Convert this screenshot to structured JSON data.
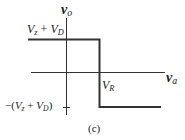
{
  "figure": {
    "caption": "(c)",
    "y_axis_label": {
      "base": "v",
      "sub": "o"
    },
    "x_axis_label": {
      "base": "v",
      "sub": "a"
    },
    "upper_level_label": {
      "a": "V",
      "a_sub": "z",
      "op": " + ",
      "b": "V",
      "b_sub": "D"
    },
    "lower_level_label": {
      "prefix": "−(",
      "a": "V",
      "a_sub": "z",
      "op": " + ",
      "b": "V",
      "b_sub": "D",
      "suffix": ")"
    },
    "threshold_label": {
      "base": "V",
      "sub": "R"
    },
    "colors": {
      "axis": "#333333",
      "curve": "#333333",
      "background": "#ffffff"
    }
  },
  "transfer_characteristic": {
    "type": "step",
    "high_level": "V_z + V_D",
    "low_level": "-(V_z + V_D)",
    "threshold": "V_R",
    "segments": [
      {
        "from": "x<V_R",
        "vo": "V_z + V_D"
      },
      {
        "at": "V_R",
        "transition": "vertical drop"
      },
      {
        "from": "x>V_R",
        "vo": "-(V_z + V_D)"
      }
    ]
  }
}
